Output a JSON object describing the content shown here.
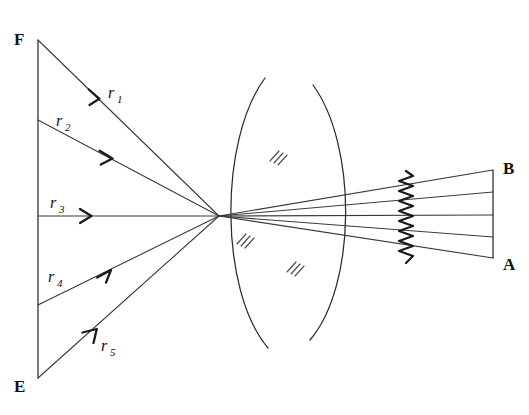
{
  "figure": {
    "background_color": "#ffffff",
    "ink_color": "#2b2b2b",
    "width": 529,
    "height": 415
  },
  "object_plane": {
    "name": "object-line-FE",
    "top_label": "F",
    "bottom_label": "E",
    "x": 38,
    "y_top": 40,
    "y_bottom": 378
  },
  "image_plane": {
    "name": "image-line-BA",
    "top_label": "B",
    "bottom_label": "A",
    "x": 493,
    "y_top": 170,
    "y_bottom": 258
  },
  "rays": [
    {
      "id": "r1",
      "label": "r",
      "sub": "1",
      "label_x": 112,
      "label_y": 94,
      "start_x": 38,
      "start_y": 40,
      "end_x": 219,
      "end_y": 216,
      "arrow_t": 0.33,
      "image_y": 170
    },
    {
      "id": "r2",
      "label": "r",
      "sub": "2",
      "label_x": 60,
      "label_y": 124,
      "start_x": 38,
      "start_y": 120,
      "end_x": 219,
      "end_y": 216,
      "arrow_t": 0.4,
      "image_y": 192
    },
    {
      "id": "r3",
      "label": "r",
      "sub": "3",
      "label_x": 54,
      "label_y": 205,
      "start_x": 38,
      "start_y": 216,
      "end_x": 219,
      "end_y": 216,
      "arrow_t": 0.28,
      "image_y": 215
    },
    {
      "id": "r4",
      "label": "r",
      "sub": "4",
      "label_x": 52,
      "label_y": 280,
      "start_x": 38,
      "start_y": 305,
      "end_x": 219,
      "end_y": 216,
      "arrow_t": 0.4,
      "image_y": 237
    },
    {
      "id": "r5",
      "label": "r",
      "sub": "5",
      "label_x": 105,
      "label_y": 349,
      "start_x": 38,
      "start_y": 378,
      "end_x": 219,
      "end_y": 216,
      "arrow_t": 0.3,
      "image_y": 258
    }
  ],
  "focal_point": {
    "name": "convergence-point",
    "x": 219,
    "y": 216
  },
  "lens": {
    "name": "biconvex-lens",
    "left_surface": {
      "top_x": 265,
      "top_y": 78,
      "bottom_x": 268,
      "bottom_y": 348,
      "bulge": -46
    },
    "right_surface": {
      "top_x": 313,
      "top_y": 85,
      "bottom_x": 310,
      "bottom_y": 340,
      "bulge": 44
    },
    "hatch_marks": [
      {
        "x": 276,
        "y": 157
      },
      {
        "x": 243,
        "y": 240
      },
      {
        "x": 293,
        "y": 268
      }
    ]
  },
  "screen": {
    "name": "wavy-screen",
    "x": 406,
    "y_top": 171,
    "y_bottom": 263,
    "amplitude": 7,
    "periods": 9
  }
}
